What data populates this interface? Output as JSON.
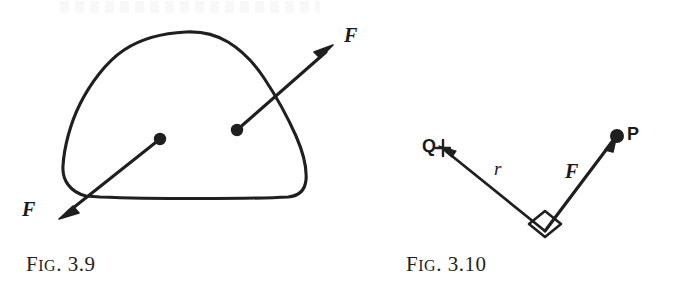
{
  "page": {
    "background_color": "#ffffff",
    "ink_color": "#1a1a1a",
    "width": 679,
    "height": 299
  },
  "figures": [
    {
      "id": "fig-3-9",
      "caption_prefix": "F",
      "caption_smallcaps": "IG",
      "caption_number": ". 3.9",
      "caption_full": "FIG. 3.9",
      "description": "closed irregular blob (rigid body) with two interior points, each the origin of a force vector F; the two vectors are parallel and point in opposite directions",
      "labels": [
        {
          "name": "force-vector-label-upper-right",
          "text": "F"
        },
        {
          "name": "force-vector-label-lower-left",
          "text": "F"
        }
      ]
    },
    {
      "id": "fig-3-10",
      "caption_prefix": "F",
      "caption_smallcaps": "IG",
      "caption_number": ". 3.10",
      "caption_full": "FIG. 3.10",
      "description": "point Q joined by segment r to a vertex, where a force vector F meets it at a right angle and runs up to point P",
      "labels": [
        {
          "name": "point-label-q",
          "text": "Q"
        },
        {
          "name": "radius-label-r",
          "text": "r"
        },
        {
          "name": "force-vector-label-f",
          "text": "F"
        },
        {
          "name": "point-label-p",
          "text": "P"
        }
      ],
      "right_angle_marker": true
    }
  ]
}
